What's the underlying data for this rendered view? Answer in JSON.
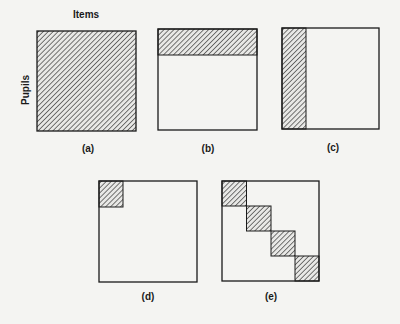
{
  "axes": {
    "top_label": "Items",
    "left_label": "Pupils"
  },
  "colors": {
    "outline": "#1a1a1a",
    "hatch": "#333333",
    "background": "#f4f4f2"
  },
  "panels": [
    {
      "id": "a",
      "label": "(a)",
      "shading": "full"
    },
    {
      "id": "b",
      "label": "(b)",
      "shading": "top-row-band"
    },
    {
      "id": "c",
      "label": "(c)",
      "shading": "left-column-band"
    },
    {
      "id": "d",
      "label": "(d)",
      "shading": "top-left-block"
    },
    {
      "id": "e",
      "label": "(e)",
      "shading": "diagonal-blocks"
    }
  ]
}
